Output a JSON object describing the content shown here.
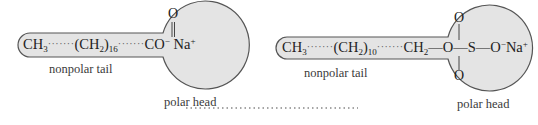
{
  "molecules": [
    {
      "name": "sodium stearate",
      "tail_start": "CH",
      "tail_start_sub": "3",
      "dots1": "·······",
      "chain_group": "(CH",
      "chain_sub_h": "2",
      "chain_close": ")",
      "chain_n": "16",
      "dots2": "·······",
      "head_carbonyl_O": "O",
      "head_group": "CO",
      "head_charge": "−",
      "counterion": "Na",
      "counterion_charge": "+",
      "tail_label": "nonpolar tail",
      "head_label": "polar head"
    },
    {
      "name": "sodium lauryl sulfate",
      "tail_start": "CH",
      "tail_start_sub": "3",
      "dots1": "·······",
      "chain_group": "(CH",
      "chain_sub_h": "2",
      "chain_close": ")",
      "chain_n": "10",
      "dots2": "·······",
      "ch2": "CH",
      "ch2_sub": "2",
      "bond1": "—O—",
      "sulfur": "S",
      "bond2": "—O",
      "head_charge": "−",
      "counterion": "Na",
      "counterion_charge": "+",
      "oxygen_top": "O",
      "oxygen_bottom": "O",
      "tail_label": "nonpolar tail",
      "head_label": "polar head"
    }
  ],
  "colors": {
    "shape_fill": "#e4e4e4",
    "shape_stroke": "#555555",
    "text": "#222222"
  }
}
